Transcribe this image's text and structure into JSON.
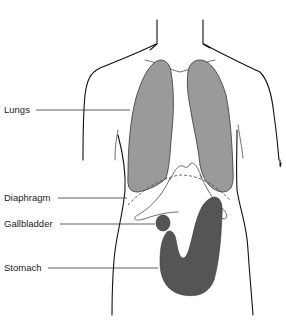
{
  "diagram": {
    "colors": {
      "lungs": "#9a9a9a",
      "stomach": "#555555",
      "gallbladder": "#555555",
      "outline": "#111111",
      "background": "#ffffff"
    },
    "labels": [
      {
        "id": "lungs",
        "text": "Lungs"
      },
      {
        "id": "diaphragm",
        "text": "Diaphragm"
      },
      {
        "id": "gallbladder",
        "text": "Gallbladder"
      },
      {
        "id": "stomach",
        "text": "Stomach"
      }
    ]
  }
}
